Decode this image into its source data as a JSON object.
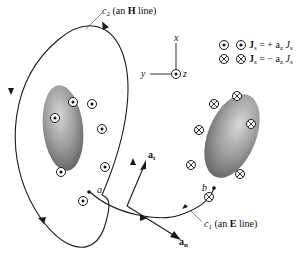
{
  "diagram": {
    "c2_label": {
      "name": "c",
      "sub": "2",
      "text_pre": "(an ",
      "bold": "H",
      "text_post": " line)"
    },
    "c1_label": {
      "name": "c",
      "sub": "1",
      "text_pre": "(an ",
      "bold": "E",
      "text_post": " line)"
    },
    "axes": {
      "x": "x",
      "y": "y",
      "z": "z"
    },
    "legend": [
      {
        "symbol": "dot-in-circle",
        "lhs": "J",
        "lhs_sub": "s",
        "eq": "= + a",
        "a_sub": "z",
        "rhs": "J",
        "rhs_sub": "s"
      },
      {
        "symbol": "cross-in-circle",
        "lhs": "J",
        "lhs_sub": "s",
        "eq": "= − a",
        "a_sub": "z",
        "rhs": "J",
        "rhs_sub": "s"
      }
    ],
    "points": {
      "a": "a",
      "b": "b"
    },
    "vectors": {
      "at": "a",
      "at_sub": "t",
      "an": "a",
      "an_sub": "n"
    },
    "colors": {
      "conductor_light": "#c8c8c8",
      "conductor_dark": "#6a6a6a",
      "line": "#1a1a1a"
    }
  }
}
